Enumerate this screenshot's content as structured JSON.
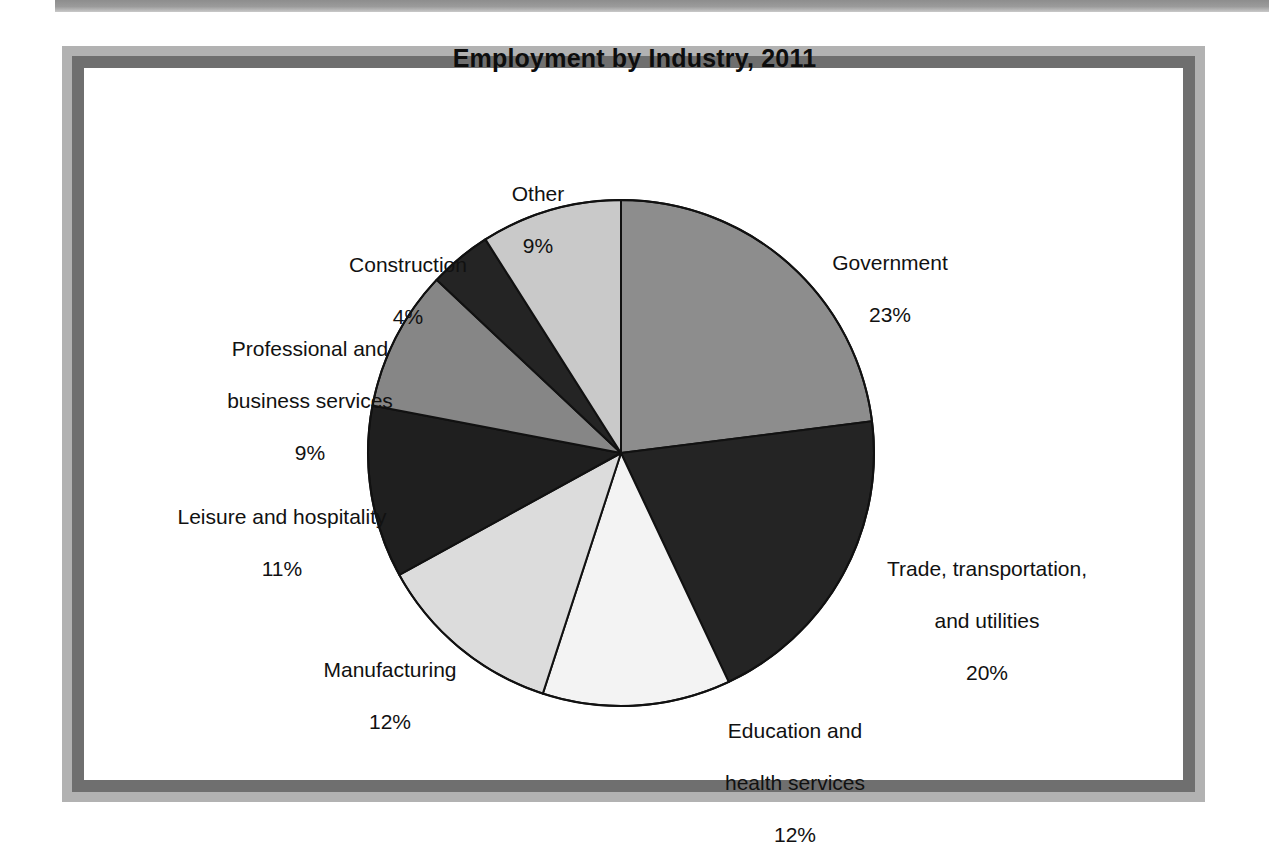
{
  "document": {
    "type": "scanned-figure",
    "background": "#ffffff"
  },
  "frame": {
    "outer_color": "#b2b2b2",
    "inner_color": "#6f6f6f",
    "canvas_color": "#ffffff",
    "scan_bar_color": "#9b9b9b"
  },
  "chart_data": {
    "type": "pie",
    "title": "Employment by Industry, 2011",
    "xlabel": "",
    "ylabel": "",
    "units": "percent",
    "start_angle_deg": 0,
    "direction": "clockwise",
    "legend": "none (direct labels)",
    "grid": false,
    "categories": [
      "Government",
      "Trade, transportation, and utilities",
      "Education and health services",
      "Manufacturing",
      "Leisure and hospitality",
      "Professional and business services",
      "Construction",
      "Other"
    ],
    "values": [
      23,
      20,
      12,
      12,
      11,
      9,
      4,
      9
    ],
    "value_labels": [
      "23%",
      "20%",
      "12%",
      "12%",
      "11%",
      "9%",
      "4%",
      "9%"
    ],
    "slice_colors": [
      "#8d8d8d",
      "#242424",
      "#f3f3f3",
      "#dcdcdc",
      "#1f1f1f",
      "#868686",
      "#242424",
      "#c9c9c9"
    ],
    "slices": [
      {
        "name": "Government",
        "label_lines": [
          "Government"
        ],
        "value": 23,
        "value_label": "23%",
        "color": "#8d8d8d"
      },
      {
        "name": "Trade, transportation, and utilities",
        "label_lines": [
          "Trade, transportation,",
          "and utilities"
        ],
        "value": 20,
        "value_label": "20%",
        "color": "#242424"
      },
      {
        "name": "Education and health services",
        "label_lines": [
          "Education and",
          "health services"
        ],
        "value": 12,
        "value_label": "12%",
        "color": "#f3f3f3"
      },
      {
        "name": "Manufacturing",
        "label_lines": [
          "Manufacturing"
        ],
        "value": 12,
        "value_label": "12%",
        "color": "#dcdcdc"
      },
      {
        "name": "Leisure and hospitality",
        "label_lines": [
          "Leisure and hospitality"
        ],
        "value": 11,
        "value_label": "11%",
        "color": "#1f1f1f"
      },
      {
        "name": "Professional and business services",
        "label_lines": [
          "Professional and",
          "business services"
        ],
        "value": 9,
        "value_label": "9%",
        "color": "#868686"
      },
      {
        "name": "Construction",
        "label_lines": [
          "Construction"
        ],
        "value": 4,
        "value_label": "4%",
        "color": "#242424"
      },
      {
        "name": "Other",
        "label_lines": [
          "Other"
        ],
        "value": 9,
        "value_label": "9%",
        "color": "#c9c9c9"
      }
    ],
    "geometry": {
      "center_x": 621,
      "center_y": 453,
      "radius": 253,
      "outline_color": "#111111",
      "outline_width": 2
    }
  },
  "labels": {
    "government": {
      "line1": "Government",
      "value": "23%"
    },
    "trade": {
      "line1": "Trade, transportation,",
      "line2": "and utilities",
      "value": "20%"
    },
    "education": {
      "line1": "Education and",
      "line2": "health services",
      "value": "12%"
    },
    "manufacturing": {
      "line1": "Manufacturing",
      "value": "12%"
    },
    "leisure": {
      "line1": "Leisure and hospitality",
      "value": "11%"
    },
    "professional": {
      "line1": "Professional and",
      "line2": "business services",
      "value": "9%"
    },
    "construction": {
      "line1": "Construction",
      "value": "4%"
    },
    "other": {
      "line1": "Other",
      "value": "9%"
    }
  }
}
